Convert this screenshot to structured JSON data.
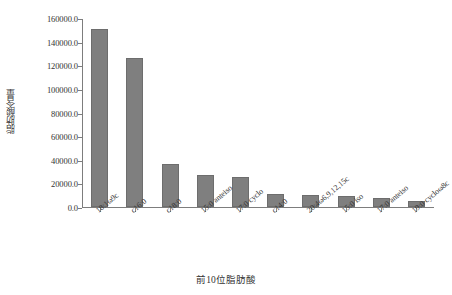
{
  "chart_data": {
    "type": "bar",
    "title": "",
    "xlabel": "前10位脂肪酸",
    "ylabel": "脂肪酸含量",
    "categories": [
      "18:1ω9c",
      "c16:0",
      "c18:0",
      "15:0 anteiso",
      "17:0 cyclo",
      "c14:0",
      "20:4ω6,9,12,15c",
      "15:0 iso",
      "17:0 anteiso",
      "19:0 cycloω8c"
    ],
    "values": [
      151000.0,
      126000.0,
      36000.0,
      27000.0,
      25000.0,
      11000.0,
      10500.0,
      9000.0,
      7500.0,
      5500.0
    ],
    "ylim": [
      0.0,
      160000.0
    ],
    "ytick_values": [
      0.0,
      20000.0,
      40000.0,
      60000.0,
      80000.0,
      100000.0,
      120000.0,
      140000.0,
      160000.0
    ],
    "ytick_labels": [
      "0.0",
      "20000.0",
      "40000.0",
      "60000.0",
      "80000.0",
      "100000.0",
      "120000.0",
      "140000.0",
      "160000.0"
    ],
    "grid": false,
    "legend": null,
    "bar_color": "#7f7f7f",
    "axis_color": "#7d7d7d",
    "background": "#ffffff"
  }
}
